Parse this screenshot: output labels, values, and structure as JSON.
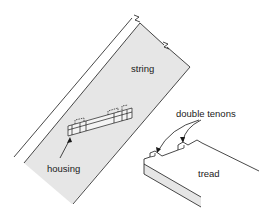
{
  "diagram": {
    "labels": {
      "string": "string",
      "housing": "housing",
      "double_tenons": "double tenons",
      "tread": "tread"
    },
    "colors": {
      "line": "#1a1a1a",
      "fill": "#e6e6e6",
      "background": "#ffffff"
    }
  }
}
